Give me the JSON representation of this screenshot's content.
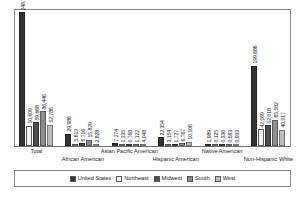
{
  "chart_data": {
    "type": "bar",
    "title": "",
    "subtitle": "",
    "xlabel": "",
    "ylabel": "",
    "grid": false,
    "legend_position": "bottom",
    "ylim": [
      0,
      248711
    ],
    "categories": [
      "Total",
      "African American",
      "Asian Pacific American",
      "Hispanic American",
      "Native American",
      "Non-Hispanic White"
    ],
    "series": [
      {
        "name": "United States",
        "color": "#333333",
        "values": [
          248711,
          29986,
          7274,
          22354,
          1989,
          199686
        ],
        "labels": [
          "248,711",
          "29,986",
          "7,274",
          "22,354",
          "1,989",
          "199,686"
        ]
      },
      {
        "name": "Northeast",
        "color": "#f2f2f2",
        "values": [
          50609,
          5613,
          1335,
          3154,
          125,
          42069
        ],
        "labels": [
          "50,609",
          "5,613",
          "1,335",
          "3,154",
          "0,125",
          "42,069"
        ]
      },
      {
        "name": "Midwest",
        "color": "#4f4f4f",
        "values": [
          59668,
          6716,
          768,
          1727,
          336,
          52018
        ],
        "labels": [
          "59,668",
          "6,716",
          "0,768",
          "1,727",
          "0,336",
          "52,018"
        ]
      },
      {
        "name": "South",
        "color": "#8d8d8d",
        "values": [
          86446,
          15829,
          1122,
          6767,
          563,
          65582
        ],
        "labels": [
          "86,446",
          "15,829",
          "1,122",
          "6,767",
          "0,563",
          "65,582"
        ]
      },
      {
        "name": "West",
        "color": "#bdbdbd",
        "values": [
          52786,
          2828,
          4048,
          10106,
          933,
          40017
        ],
        "labels": [
          "52,786",
          "2,828",
          "4,048",
          "10,106",
          "0,933",
          "40,017"
        ]
      }
    ]
  },
  "legend": {
    "items": [
      {
        "label": "United States",
        "color": "#333333"
      },
      {
        "label": "Northeast",
        "color": "#f2f2f2"
      },
      {
        "label": "Midwest",
        "color": "#4f4f4f"
      },
      {
        "label": "South",
        "color": "#8d8d8d"
      },
      {
        "label": "West",
        "color": "#bdbdbd"
      }
    ]
  }
}
